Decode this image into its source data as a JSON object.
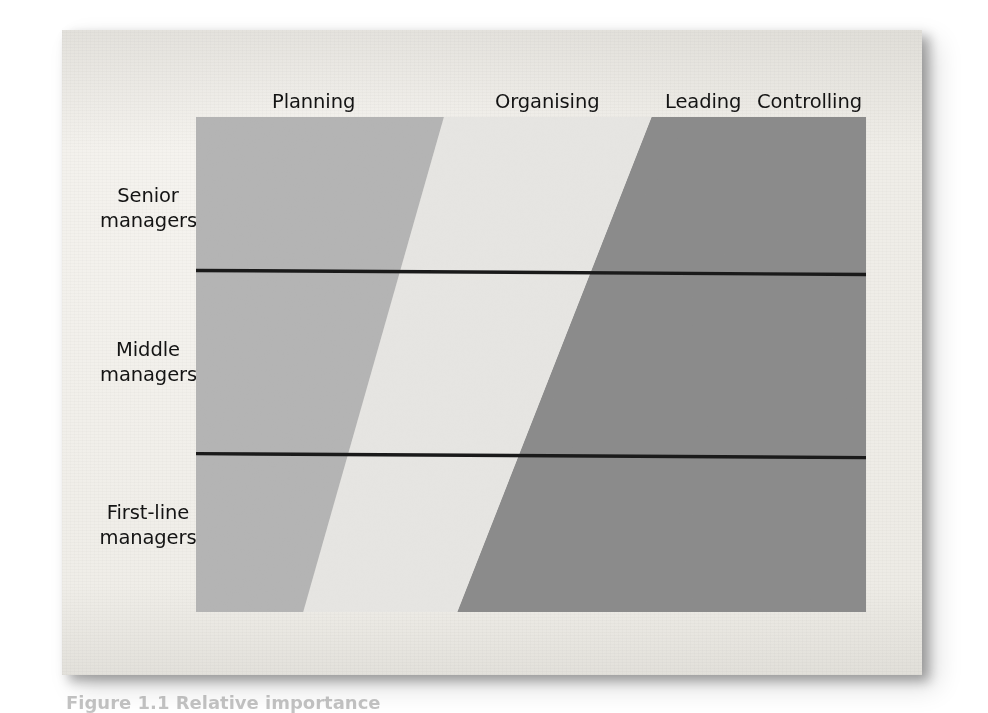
{
  "figure": {
    "caption": "Figure 1.1 Relative importance",
    "column_headers": [
      {
        "label": "Planning"
      },
      {
        "label": "Organising"
      },
      {
        "label": "Leading"
      },
      {
        "label": "Controlling"
      }
    ],
    "row_labels": [
      {
        "line1": "Senior",
        "line2": "managers"
      },
      {
        "line1": "Middle",
        "line2": "managers"
      },
      {
        "line1": "First-line",
        "line2": "managers"
      }
    ]
  },
  "colors": {
    "paper": "#f1efea",
    "band_planning": "#b4b4b4",
    "band_organising": "#e6e5e2",
    "band_leading_controlling": "#8b8b8b",
    "divider": "#1a1a1a",
    "text": "#141414"
  },
  "chart_data": {
    "type": "area",
    "title": "",
    "subtitle": "",
    "xlabel": "",
    "ylabel": "",
    "orientation": "horizontal-stacked-bands",
    "grid": false,
    "legend_position": "top",
    "categories": [
      "Senior managers",
      "Middle managers",
      "First-line managers"
    ],
    "legend": [
      "Planning",
      "Organising",
      "Leading",
      "Controlling"
    ],
    "note": "Proportion of each management level's time devoted to the four management functions. Band widths are read across each row as a percentage of total row width.",
    "xlim": [
      0,
      100
    ],
    "series": [
      {
        "name": "Planning",
        "values": [
          37,
          27,
          16
        ]
      },
      {
        "name": "Organising",
        "values": [
          31,
          28,
          23
        ]
      },
      {
        "name": "Leading",
        "values": [
          16,
          22,
          30
        ]
      },
      {
        "name": "Controlling",
        "values": [
          16,
          23,
          31
        ]
      }
    ],
    "band_boundaries_percent": {
      "planning_organising": {
        "top": 37,
        "bottom": 16
      },
      "organising_leading": {
        "top": 68,
        "bottom": 39
      }
    },
    "row_dividers_percent_height": [
      31,
      68
    ]
  }
}
